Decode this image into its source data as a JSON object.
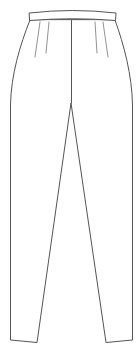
{
  "figure": {
    "type": "technical flat sketch",
    "top_label": "",
    "colors": {
      "line": "#555555",
      "dart_line": "#777777",
      "background": "#ffffff"
    }
  },
  "parts": {
    "waistband": "waistband",
    "front_darts": [
      "left-outer-dart",
      "left-inner-dart",
      "right-inner-dart",
      "right-outer-dart"
    ],
    "center_seam": "center-front-seam",
    "legs": [
      "left-leg",
      "right-leg"
    ],
    "hems": [
      "left-hem",
      "right-hem"
    ]
  }
}
